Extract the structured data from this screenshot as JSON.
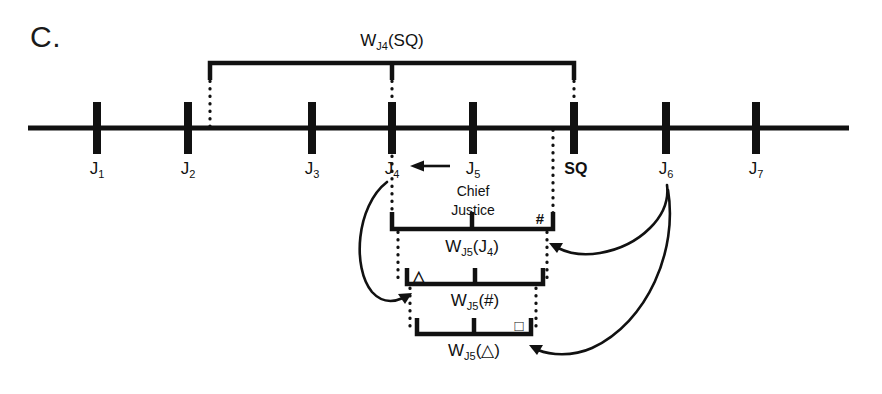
{
  "figure": {
    "panel_letter": "C.",
    "top_bracket_label_main": "W",
    "top_bracket_label_sub": "J",
    "top_bracket_label_subnum": "4",
    "top_bracket_label_arg": "(SQ)"
  },
  "axis": {
    "name": "policy-space-line",
    "ticks": [
      {
        "id": "j1",
        "label_main": "J",
        "label_sub": "1",
        "x": 97,
        "bold": false
      },
      {
        "id": "j2",
        "label_main": "J",
        "label_sub": "2",
        "x": 188,
        "bold": false
      },
      {
        "id": "j3",
        "label_main": "J",
        "label_sub": "3",
        "x": 312,
        "bold": false
      },
      {
        "id": "j4",
        "label_main": "J",
        "label_sub": "4",
        "x": 392,
        "bold": false
      },
      {
        "id": "j5",
        "label_main": "J",
        "label_sub": "5",
        "x": 473,
        "bold": false
      },
      {
        "id": "sq",
        "label_main": "SQ",
        "label_sub": "",
        "x": 574,
        "bold": true
      },
      {
        "id": "j6",
        "label_main": "J",
        "label_sub": "6",
        "x": 666,
        "bold": false
      },
      {
        "id": "j7",
        "label_main": "J",
        "label_sub": "7",
        "x": 756,
        "bold": false
      }
    ],
    "start_x": 28,
    "end_x": 849,
    "y": 128
  },
  "annotations": {
    "chief_justice_line1": "Chief",
    "chief_justice_line2": "Justice",
    "median_arrow_name": "j5-to-j4-median-arrow"
  },
  "brackets": [
    {
      "id": "w-j4-sq",
      "orientation": "down",
      "label_main": "W",
      "label_sub": "J",
      "label_subnum": "4",
      "label_arg": "(SQ)",
      "left_x": 210,
      "right_x": 574,
      "bar_y": 63,
      "center_x": 392,
      "end_glyph_left": "",
      "end_glyph_right": ""
    },
    {
      "id": "w-j5-j4",
      "orientation": "up",
      "label_main": "W",
      "label_sub": "J",
      "label_subnum": "5",
      "label_arg": "(J",
      "label_arg_sub": "4",
      "label_arg_tail": ")",
      "left_x": 392,
      "right_x": 553,
      "bar_y": 228,
      "center_x": 472,
      "end_glyph_left": "",
      "end_glyph_right": "#"
    },
    {
      "id": "w-j5-hash",
      "orientation": "up",
      "label_main": "W",
      "label_sub": "J",
      "label_subnum": "5",
      "label_arg": "(#)",
      "left_x": 407,
      "right_x": 543,
      "bar_y": 283,
      "center_x": 475,
      "end_glyph_left": "△",
      "end_glyph_right": ""
    },
    {
      "id": "w-j5-triangle",
      "orientation": "up",
      "label_main": "W",
      "label_sub": "J",
      "label_subnum": "5",
      "label_arg": "(△)",
      "left_x": 417,
      "right_x": 531,
      "bar_y": 333,
      "center_x": 474,
      "end_glyph_left": "",
      "end_glyph_right": "□"
    }
  ],
  "colors": {
    "ink": "#111111",
    "background": "#ffffff"
  }
}
